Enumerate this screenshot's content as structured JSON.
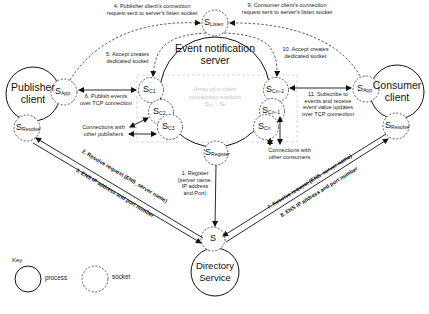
{
  "nodes": {
    "publisher": {
      "line1": "Publisher",
      "line2": "client"
    },
    "consumer": {
      "line1": "Consumer",
      "line2": "client"
    },
    "server": {
      "line1": "Event notification",
      "line2": "server"
    },
    "directory": {
      "line1": "Directory",
      "line2": "Service"
    }
  },
  "sockets": {
    "listen": {
      "main": "S",
      "sub": "Listen"
    },
    "pub_app": {
      "main": "S",
      "sub": "App"
    },
    "pub_resolve": {
      "main": "S",
      "sub": "Resolve"
    },
    "con_app": {
      "main": "S",
      "sub": "App"
    },
    "con_resolve": {
      "main": "S",
      "sub": "Resolve"
    },
    "c1": {
      "main": "S",
      "sub": "C1"
    },
    "c2": {
      "main": "S",
      "sub": "C2"
    },
    "c3": {
      "main": "S",
      "sub": "C3"
    },
    "cn2": {
      "main": "S",
      "sub": "Cn−2"
    },
    "cn1": {
      "main": "S",
      "sub": "Cn−1"
    },
    "cn": {
      "main": "S",
      "sub": "Cn"
    },
    "register": {
      "main": "S",
      "sub": "Register"
    },
    "dir": {
      "main": "S",
      "sub": ""
    }
  },
  "array_label": {
    "line1": "Array of n client",
    "line2": "connection sockets",
    "line3": "S₁₁…Sₙ"
  },
  "steps": {
    "s1": {
      "l1": "1. Register",
      "l2": "(server name,",
      "l3": "IP address",
      "l4": "and Port)"
    },
    "s2": "2. Resolve request (ENS_server name)",
    "s3": "3. ENS IP address and port number",
    "s4": {
      "l1": "4. Publisher client's connection",
      "l2": "request sent to server's listen socket"
    },
    "s5": {
      "l1": "5. Accept creates",
      "l2": "dedicated socket"
    },
    "s6": {
      "l1": "6. Publish events",
      "l2": "over TCP connection"
    },
    "s7": "7. Resolve request (ENS_server name)",
    "s8": "8. ENS IP address and port number",
    "s9": {
      "l1": "9. Consumer client's connection",
      "l2": "request sent to server's listen socket"
    },
    "s10": {
      "l1": "10. Accept creates",
      "l2": "dedicated socket"
    },
    "s11": {
      "l1": "11. Subscribe to",
      "l2": "events and receive",
      "l3": "event value updates",
      "l4": "over TCP connection"
    }
  },
  "annotations": {
    "pub_conn": {
      "l1": "Connections with",
      "l2": "other publishers"
    },
    "con_conn": {
      "l1": "Connections with",
      "l2": "other consumers"
    }
  },
  "key": {
    "title": "Key",
    "process": "process",
    "socket": "socket"
  },
  "colors": {
    "line": "#111111",
    "dashed": "#333333",
    "faint_text": "#c4c4c4",
    "faint_box": "#d0d0d0"
  }
}
